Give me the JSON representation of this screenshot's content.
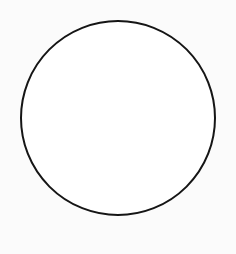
{
  "canvas": {
    "width": 236,
    "height": 254,
    "background": "#fbfbfb"
  },
  "shapes": [
    {
      "type": "circle",
      "label": "circle",
      "cx": 118,
      "cy": 118,
      "r": 97,
      "stroke": "#151515",
      "stroke_width": 2,
      "fill": "#ffffff"
    }
  ]
}
